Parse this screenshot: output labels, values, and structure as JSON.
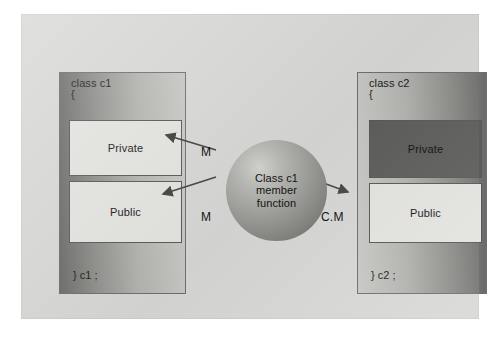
{
  "diagram": {
    "background_color": "#d8d8d6",
    "page_color": "#ffffff"
  },
  "left_class": {
    "name": "class c1",
    "brace_open": "{",
    "brace_close": "} c1 ;",
    "sections": [
      {
        "label": "Private",
        "fill": "light"
      },
      {
        "label": "Public",
        "fill": "light"
      }
    ]
  },
  "right_class": {
    "name": "class c2",
    "brace_open": "{",
    "brace_close": "} c2 ;",
    "sections": [
      {
        "label": "Private",
        "fill": "dark"
      },
      {
        "label": "Public",
        "fill": "light"
      }
    ]
  },
  "center_node": {
    "text": "Class c1\nmember\nfunction",
    "shape": "sphere"
  },
  "arrows": [
    {
      "id": "m-top",
      "label": "M",
      "from": "center_node",
      "to": "left_class.Private"
    },
    {
      "id": "m-bottom",
      "label": "M",
      "from": "center_node",
      "to": "left_class.Public"
    },
    {
      "id": "cm",
      "label": "C.M",
      "from": "center_node",
      "to": "right_class.Public"
    }
  ],
  "colors": {
    "box_dark": "#5d5d5b",
    "box_light": "#e4e4e1",
    "stroke": "#585856",
    "text": "#161616"
  }
}
